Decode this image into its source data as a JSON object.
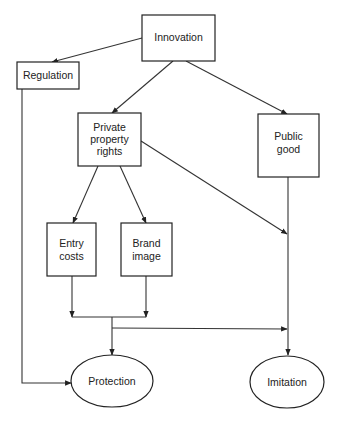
{
  "diagram": {
    "nodes": {
      "innovation": {
        "lines": [
          "Innovation"
        ],
        "shape": "rect"
      },
      "regulation": {
        "lines": [
          "Regulation"
        ],
        "shape": "rect"
      },
      "private_property_rights": {
        "lines": [
          "Private",
          "property",
          "rights"
        ],
        "shape": "rect"
      },
      "public_good": {
        "lines": [
          "Public",
          "good"
        ],
        "shape": "rect"
      },
      "entry_costs": {
        "lines": [
          "Entry",
          "costs"
        ],
        "shape": "rect"
      },
      "brand_image": {
        "lines": [
          "Brand",
          "image"
        ],
        "shape": "rect"
      },
      "protection": {
        "lines": [
          "Protection"
        ],
        "shape": "ellipse"
      },
      "imitation": {
        "lines": [
          "Imitation"
        ],
        "shape": "ellipse"
      }
    },
    "edges": [
      {
        "from": "Innovation",
        "to": "Regulation"
      },
      {
        "from": "Innovation",
        "to": "Private property rights"
      },
      {
        "from": "Innovation",
        "to": "Public good"
      },
      {
        "from": "Private property rights",
        "to": "Entry costs"
      },
      {
        "from": "Private property rights",
        "to": "Brand image"
      },
      {
        "from": "Private property rights",
        "to": "Imitation"
      },
      {
        "from": "Public good",
        "to": "Imitation"
      },
      {
        "from": "Entry costs",
        "to": "Protection"
      },
      {
        "from": "Brand image",
        "to": "Protection"
      },
      {
        "from": "Entry costs + Brand image",
        "to": "Imitation"
      },
      {
        "from": "Regulation",
        "to": "Protection"
      }
    ],
    "colors": {
      "stroke": "#222222",
      "background": "#ffffff",
      "text": "#222222"
    }
  }
}
